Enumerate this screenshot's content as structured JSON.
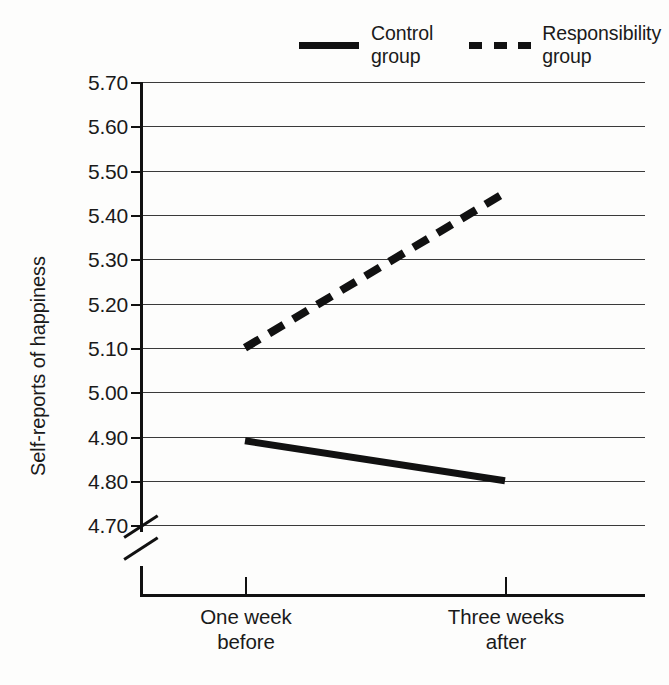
{
  "chart_data": {
    "type": "line",
    "title": "",
    "xlabel": "",
    "ylabel": "Self-reports of happiness",
    "categories": [
      "One week before",
      "Three weeks after"
    ],
    "x_tick_labels": [
      "One week\nbefore",
      "Three weeks\nafter"
    ],
    "y_tick_labels": [
      "5.70",
      "5.60",
      "5.50",
      "5.40",
      "5.30",
      "5.20",
      "5.10",
      "5.00",
      "4.90",
      "4.80",
      "4.70"
    ],
    "y_tick_values": [
      5.7,
      5.6,
      5.5,
      5.4,
      5.3,
      5.2,
      5.1,
      5.0,
      4.9,
      4.8,
      4.7
    ],
    "ylim": [
      4.7,
      5.7
    ],
    "y_step": 0.1,
    "axis_break": true,
    "axis_break_note": "y-axis broken below 4.70",
    "grid": true,
    "grid_axis": "y",
    "legend_position": "top",
    "series": [
      {
        "name": "Control group",
        "legend_label": "Control\ngroup",
        "style": "solid",
        "color": "#111111",
        "values": [
          4.89,
          4.8
        ]
      },
      {
        "name": "Responsibility group",
        "legend_label": "Responsibility\ngroup",
        "style": "dashed",
        "color": "#111111",
        "values": [
          5.1,
          5.45
        ]
      }
    ]
  },
  "legend": {
    "control_label": "Control\ngroup",
    "responsibility_label": "Responsibility\ngroup"
  },
  "axis": {
    "y_title": "Self-reports of happiness",
    "y_labels": {
      "t0": "5.70",
      "t1": "5.60",
      "t2": "5.50",
      "t3": "5.40",
      "t4": "5.30",
      "t5": "5.20",
      "t6": "5.10",
      "t7": "5.00",
      "t8": "4.90",
      "t9": "4.80",
      "t10": "4.70"
    },
    "x_labels": {
      "left": "One week\nbefore",
      "right": "Three weeks\nafter"
    }
  }
}
